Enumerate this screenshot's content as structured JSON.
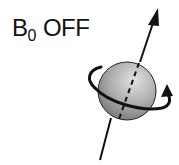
{
  "label": {
    "symbol": "B",
    "subscript": "0",
    "state": "OFF"
  },
  "diagram": {
    "colors": {
      "stroke": "#111111",
      "sphere_light": "#d8d8d8",
      "sphere_dark": "#7a7a7a"
    }
  }
}
